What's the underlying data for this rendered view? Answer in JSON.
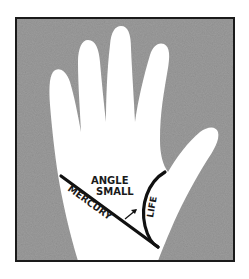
{
  "diagram": {
    "type": "palmistry-hand-illustration",
    "colors": {
      "background_page": "#ffffff",
      "frame_border": "#1a1a1a",
      "panel_fill": "#9a9a9a",
      "hand_fill": "#ffffff",
      "line_color": "#111111"
    },
    "labels": {
      "angle_line1": "ANGLE",
      "angle_line2": "SMALL",
      "mercury": "MERCURY",
      "life": "LIFE"
    },
    "elements": {
      "hand": "right-hand-palm-silhouette",
      "mercury_line": "straight diagonal line",
      "life_line": "curved line around thumb base",
      "arrow": "small arrow pointing to angle between lines"
    }
  }
}
